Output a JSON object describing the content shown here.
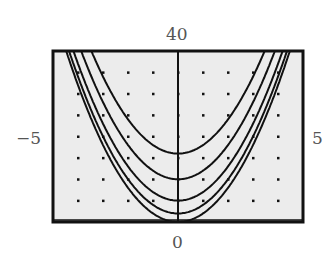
{
  "chart_data": {
    "type": "line",
    "title": "",
    "xlabel": "",
    "ylabel": "",
    "xlim": [
      -5,
      5
    ],
    "ylim": [
      0,
      40
    ],
    "grid": "dots",
    "tick_labels": {
      "xmin": "−5",
      "xmax": "5",
      "ymin": "0",
      "ymax": "40"
    },
    "series": [
      {
        "name": "y=2x^2",
        "a": 2,
        "c": 0
      },
      {
        "name": "y=2x^2+2",
        "a": 2,
        "c": 2
      },
      {
        "name": "y=2x^2+5",
        "a": 2,
        "c": 5
      },
      {
        "name": "y=2x^2+10",
        "a": 2,
        "c": 10
      },
      {
        "name": "y=2x^2+16",
        "a": 2,
        "c": 16
      }
    ]
  },
  "colors": {
    "plot_bg": "#ececec",
    "curve": "#111111",
    "frame": "#111111",
    "label": "#555555"
  }
}
